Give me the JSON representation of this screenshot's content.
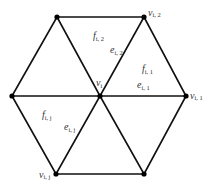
{
  "diagram": {
    "type": "hexagonal-triangle-mesh",
    "colors": {
      "edge": "#111111",
      "vertex": "#000000",
      "label": "#333333",
      "background": "#ffffff"
    },
    "vertices": [
      {
        "id": "center",
        "x": 100,
        "y": 96
      },
      {
        "id": "top-left",
        "x": 57,
        "y": 17
      },
      {
        "id": "top-right",
        "x": 144,
        "y": 17
      },
      {
        "id": "left",
        "x": 12,
        "y": 96
      },
      {
        "id": "right",
        "x": 186,
        "y": 96
      },
      {
        "id": "bottom-left",
        "x": 56,
        "y": 174
      },
      {
        "id": "bottom-right",
        "x": 144,
        "y": 174
      }
    ],
    "labels": {
      "v_i": {
        "main": "v",
        "sub": "i"
      },
      "v_i1": {
        "main": "v",
        "sub": "i, 1"
      },
      "v_i2": {
        "main": "v",
        "sub": "i, 2"
      },
      "v_ij": {
        "main": "v",
        "sub": "i, j"
      },
      "f_i1": {
        "main": "f",
        "sub": "i, 1"
      },
      "f_i2": {
        "main": "f",
        "sub": "i, 2"
      },
      "f_ij": {
        "main": "f",
        "sub": "i, j"
      },
      "e_i1": {
        "main": "e",
        "sub": "i, 1"
      },
      "e_i2": {
        "main": "e",
        "sub": "i, 2"
      },
      "e_ij": {
        "main": "e",
        "sub": "i, j"
      }
    }
  }
}
